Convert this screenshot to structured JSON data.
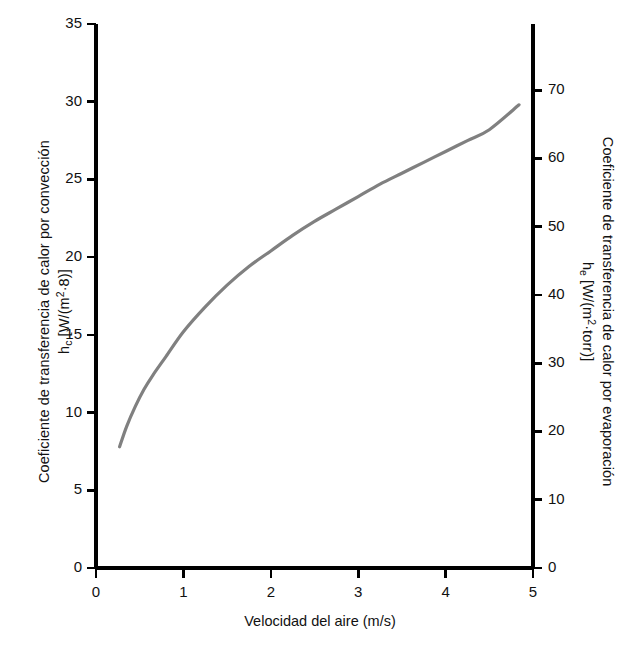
{
  "chart_data": {
    "type": "line",
    "title": "",
    "xlabel": "Velocidad del aire (m/s)",
    "ylabel_left_line1": "Coeficiente de transferencia de calor por convección",
    "ylabel_left_line2_symbol": "h",
    "ylabel_left_line2_sub": "c",
    "ylabel_left_line2_units": " [W/(m",
    "ylabel_left_line2_sup": "2",
    "ylabel_left_line2_tail": "·8)]",
    "ylabel_right_line1": "Coeficiente de transferencia de calor por evaporación",
    "ylabel_right_line2_symbol": "h",
    "ylabel_right_line2_sub": "e",
    "ylabel_right_line2_units": " [W/(m",
    "ylabel_right_line2_sup": "2",
    "ylabel_right_line2_tail": "·torr)]",
    "xlim": [
      0,
      5
    ],
    "ylim_left": [
      0,
      35
    ],
    "ylim_right": [
      0,
      79.7
    ],
    "xticks": [
      0,
      1,
      2,
      3,
      4,
      5
    ],
    "xticklabels": [
      "0",
      "1",
      "2",
      "3",
      "4",
      "5"
    ],
    "yticks_left": [
      0,
      5,
      10,
      15,
      20,
      25,
      30,
      35
    ],
    "yticklabels_left": [
      "0",
      "5",
      "10",
      "15",
      "20",
      "25",
      "30",
      "35"
    ],
    "yticks_right": [
      0,
      10,
      20,
      30,
      40,
      50,
      60,
      70
    ],
    "yticklabels_right": [
      "0",
      "10",
      "20",
      "30",
      "40",
      "50",
      "60",
      "70"
    ],
    "grid": false,
    "legend": false,
    "series": [
      {
        "name": "h_c vs air velocity",
        "color": "#808080",
        "linewidth": 3.2,
        "x": [
          0.27,
          0.35,
          0.45,
          0.55,
          0.65,
          0.8,
          1.0,
          1.25,
          1.5,
          1.75,
          2.0,
          2.25,
          2.5,
          2.75,
          3.0,
          3.25,
          3.5,
          3.75,
          4.0,
          4.25,
          4.5,
          4.84
        ],
        "y": [
          7.8,
          9.1,
          10.4,
          11.5,
          12.4,
          13.6,
          15.2,
          16.8,
          18.2,
          19.4,
          20.4,
          21.4,
          22.3,
          23.1,
          23.9,
          24.7,
          25.4,
          26.1,
          26.8,
          27.5,
          28.2,
          29.8
        ]
      }
    ]
  },
  "plot_geometry": {
    "left_px": 96,
    "right_px": 533,
    "top_px": 24,
    "bottom_px": 568
  },
  "colors": {
    "axis": "#000000",
    "curve": "#808080",
    "text": "#111111",
    "background": "#ffffff"
  }
}
